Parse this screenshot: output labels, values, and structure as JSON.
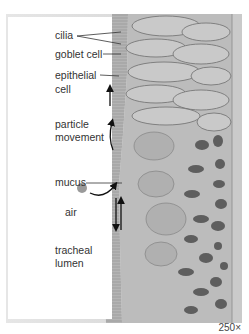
{
  "figure": {
    "magnification": "250×",
    "colors": {
      "background": "#ffffff",
      "tissue_base": "#bdbdbd",
      "cilia_band": "#a9a9a9",
      "nuclei": "#5a5a5a",
      "label_text": "#333333",
      "particle": "#9a9a9a"
    }
  },
  "labels": {
    "cilia": "cilia",
    "goblet_cell": "goblet cell",
    "epithelial_line1": "epithelial",
    "epithelial_line2": "cell",
    "particle_line1": "particle",
    "particle_line2": "movement",
    "mucus": "mucus",
    "air": "air",
    "tracheal_line1": "tracheal",
    "tracheal_line2": "lumen"
  }
}
